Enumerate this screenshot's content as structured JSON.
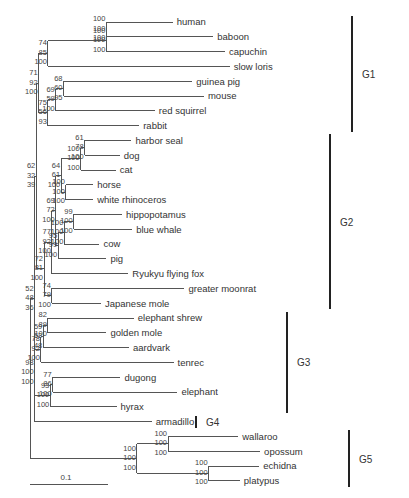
{
  "figure": {
    "type": "phylogenetic tree",
    "support_value_order": [
      "top",
      "middle",
      "bottom"
    ],
    "scale_bar_label": "0.1"
  },
  "taxa": [
    "human",
    "baboon",
    "capuchin",
    "slow loris",
    "guinea pig",
    "mouse",
    "red squirrel",
    "rabbit",
    "harbor seal",
    "dog",
    "cat",
    "horse",
    "white rhinoceros",
    "hippopotamus",
    "blue whale",
    "cow",
    "pig",
    "Ryukyu flying fox",
    "greater moonrat",
    "Japanese mole",
    "elephant shrew",
    "golden mole",
    "aardvark",
    "tenrec",
    "dugong",
    "elephant",
    "hyrax",
    "armadillo",
    "wallaroo",
    "opossum",
    "echidna",
    "platypus"
  ],
  "groups": [
    {
      "label": "G1",
      "members": [
        "human",
        "baboon",
        "capuchin",
        "slow loris",
        "guinea pig",
        "mouse",
        "red squirrel",
        "rabbit"
      ]
    },
    {
      "label": "G2",
      "members": [
        "harbor seal",
        "dog",
        "cat",
        "horse",
        "white rhinoceros",
        "hippopotamus",
        "blue whale",
        "cow",
        "pig",
        "Ryukyu flying fox",
        "greater moonrat",
        "Japanese mole"
      ]
    },
    {
      "label": "G3",
      "members": [
        "elephant shrew",
        "golden mole",
        "aardvark",
        "tenrec",
        "dugong",
        "elephant",
        "hyrax"
      ]
    },
    {
      "label": "G4",
      "members": [
        "armadillo"
      ]
    },
    {
      "label": "G5",
      "members": [
        "wallaroo",
        "opossum",
        "echidna",
        "platypus"
      ]
    }
  ],
  "tree": {
    "id": "root",
    "support": null,
    "children": [
      {
        "id": "eutheria",
        "support": [
          "52",
          "48",
          "36"
        ],
        "children": [
          {
            "id": "boreo_lauras",
            "support": [
              "62",
              "32",
              "39"
            ],
            "children": [
              {
                "id": "euarchontoglires",
                "support": [
                  "71",
                  "92",
                  "100"
                ],
                "children": [
                  {
                    "id": "primates",
                    "support": [
                      "74",
                      "85",
                      "100"
                    ],
                    "children": [
                      {
                        "id": "anthropoids",
                        "support": [
                          "100",
                          "100",
                          "100"
                        ],
                        "children": [
                          {
                            "id": "catarrhini",
                            "support": [
                              "100",
                              "100",
                              "100"
                            ],
                            "children": [
                              {
                                "leaf": "human",
                                "len": 0.085
                              },
                              {
                                "leaf": "baboon",
                                "len": 0.137
                              }
                            ],
                            "len": 0.0
                          },
                          {
                            "leaf": "capuchin",
                            "len": 0.152
                          }
                        ],
                        "len": 0.075
                      },
                      {
                        "leaf": "slow loris",
                        "len": 0.233
                      }
                    ],
                    "len": 0.012
                  },
                  {
                    "id": "glires",
                    "support": [
                      "75",
                      "56",
                      "93"
                    ],
                    "children": [
                      {
                        "id": "rodents",
                        "support": [
                          "69",
                          "59",
                          "100"
                        ],
                        "children": [
                          {
                            "id": "gp_mouse",
                            "support": [
                              "68",
                              "60",
                              "95"
                            ],
                            "children": [
                              {
                                "leaf": "guinea pig",
                                "len": 0.165
                              },
                              {
                                "leaf": "mouse",
                                "len": 0.18
                              }
                            ],
                            "len": 0.01
                          },
                          {
                            "leaf": "red squirrel",
                            "len": 0.127
                          }
                        ],
                        "len": 0.01
                      },
                      {
                        "leaf": "rabbit",
                        "len": 0.117
                      }
                    ],
                    "len": 0.012
                  }
                ],
                "len": 0.003
              },
              {
                "id": "laurasiatheria",
                "support": [
                  "72",
                  "81",
                  "100"
                ],
                "children": [
                  {
                    "id": "l1",
                    "support": [
                      "77",
                      "92",
                      "100"
                    ],
                    "children": [
                      {
                        "id": "l2",
                        "support": [
                          "69",
                          "72",
                          "100"
                        ],
                        "children": [
                          {
                            "id": "fereungulata",
                            "support": [
                              "64",
                              "61",
                              "100"
                            ],
                            "children": [
                              {
                                "id": "carnivora",
                                "support": [
                                  "100",
                                  "100",
                                  "100"
                                ],
                                "children": [
                                  {
                                    "id": "caniformia",
                                    "support": [
                                      "61",
                                      "78",
                                      "100"
                                    ],
                                    "children": [
                                      {
                                        "leaf": "harbor seal",
                                        "len": 0.06
                                      },
                                      {
                                        "leaf": "dog",
                                        "len": 0.045
                                      }
                                    ],
                                    "len": 0.005
                                  },
                                  {
                                    "leaf": "cat",
                                    "len": 0.045
                                  }
                                ],
                                "len": 0.025
                              },
                              {
                                "id": "perisso",
                                "support": [
                                  "100",
                                  "100",
                                  "100"
                                ],
                                "children": [
                                  {
                                    "leaf": "horse",
                                    "len": 0.035
                                  },
                                  {
                                    "leaf": "white rhinoceros",
                                    "len": 0.035
                                  }
                                ],
                                "len": 0.006
                              }
                            ],
                            "len": 0.007
                          },
                          {
                            "id": "cetartiodactyla",
                            "support": [
                              "95",
                              "99",
                              "100"
                            ],
                            "children": [
                              {
                                "id": "cetruminantia",
                                "support": [
                                  "100",
                                  "100",
                                  "100"
                                ],
                                "children": [
                                  {
                                    "id": "whippo",
                                    "support": [
                                      "99",
                                      "100",
                                      "100"
                                    ],
                                    "children": [
                                      {
                                        "leaf": "hippopotamus",
                                        "len": 0.062
                                      },
                                      {
                                        "leaf": "blue whale",
                                        "len": 0.075
                                      }
                                    ],
                                    "len": 0.012
                                  },
                                  {
                                    "leaf": "cow",
                                    "len": 0.045
                                  }
                                ],
                                "len": 0.008
                              },
                              {
                                "leaf": "pig",
                                "len": 0.062
                              }
                            ],
                            "len": 0.003
                          }
                        ],
                        "len": 0.005
                      },
                      {
                        "leaf": "Ryukyu flying fox",
                        "len": 0.098
                      }
                    ],
                    "len": 0.01
                  },
                  {
                    "id": "eulipotyphla",
                    "support": [
                      "74",
                      "79",
                      "100"
                    ],
                    "children": [
                      {
                        "leaf": "greater moonrat",
                        "len": 0.17
                      },
                      {
                        "leaf": "Japanese mole",
                        "len": 0.063
                      }
                    ],
                    "len": 0.01
                  }
                ],
                "len": 0.01
              }
            ],
            "len": 0.002
          },
          {
            "id": "afro_xen",
            "support": [
              "98",
              "100",
              "100"
            ],
            "children": [
              {
                "id": "afrotheria",
                "support": [
                  "78",
                  "92",
                  "100"
                ],
                "children": [
                  {
                    "id": "afroinsectiphilia",
                    "support": [
                      "59",
                      "52",
                      "48"
                    ],
                    "children": [
                      {
                        "id": "es_gm",
                        "support": [
                          "82",
                          "89",
                          "100"
                        ],
                        "children": [
                          {
                            "leaf": "elephant shrew",
                            "len": 0.11
                          },
                          {
                            "leaf": "golden mole",
                            "len": 0.075
                          }
                        ],
                        "len": 0.006
                      },
                      {
                        "leaf": "aardvark",
                        "len": 0.11
                      }
                    ],
                    "len": 0.003
                  },
                  {
                    "leaf": "tenrec",
                    "len": 0.17
                  }
                ],
                "len": 0.008
              },
              {
                "id": "paenungulata",
                "support": [
                  "93",
                  "100",
                  "100"
                ],
                "children": [
                  {
                    "id": "tethytheria",
                    "support": [
                      "77",
                      "86",
                      "100"
                    ],
                    "children": [
                      {
                        "leaf": "dugong",
                        "len": 0.087
                      },
                      {
                        "leaf": "elephant",
                        "len": 0.16
                      }
                    ],
                    "len": 0.003
                  },
                  {
                    "leaf": "hyrax",
                    "len": 0.085
                  }
                ],
                "len": 0.02
              }
            ],
            "len": 0.0
          },
          {
            "leaf": "armadillo",
            "len": 0.15
          }
        ],
        "len": 0.006
      },
      {
        "id": "non_eutherian",
        "support": [
          "100",
          "100",
          "100"
        ],
        "children": [
          {
            "id": "marsupials",
            "support": [
              "100",
              "100",
              "100"
            ],
            "children": [
              {
                "leaf": "wallaroo",
                "len": 0.09
              },
              {
                "leaf": "opossum",
                "len": 0.118
              }
            ],
            "len": 0.04
          },
          {
            "id": "monotremes",
            "support": [
              "100",
              "100",
              "100"
            ],
            "children": [
              {
                "leaf": "echidna",
                "len": 0.065
              },
              {
                "leaf": "platypus",
                "len": 0.04
              }
            ],
            "len": 0.092
          }
        ],
        "len": 0.137
      }
    ]
  }
}
